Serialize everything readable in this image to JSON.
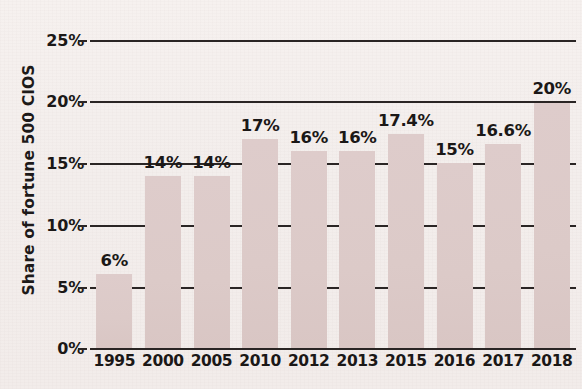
{
  "chart_data": {
    "type": "bar",
    "title": "",
    "subtitle": "",
    "xlabel": "",
    "ylabel": "Share of fortune 500 CIOS",
    "categories": [
      "1995",
      "2000",
      "2005",
      "2010",
      "2012",
      "2013",
      "2015",
      "2016",
      "2017",
      "2018"
    ],
    "values": [
      6,
      14,
      14,
      17,
      16,
      16,
      17.4,
      15,
      16.6,
      20
    ],
    "data_labels": [
      "6%",
      "14%",
      "14%",
      "17%",
      "16%",
      "16%",
      "17.4%",
      "15%",
      "16.6%",
      "20%"
    ],
    "ylim": [
      0,
      25
    ],
    "ytick_values": [
      0,
      5,
      10,
      15,
      20,
      25
    ],
    "ytick_labels": [
      "0%",
      "5%",
      "10%",
      "15%",
      "20%",
      "25%"
    ],
    "grid": true,
    "grid_axis": "y",
    "legend": false,
    "legend_position": "none",
    "bar_color": "#ddcbc9",
    "text_color": "#1b1817",
    "grid_color": "#2a2524",
    "background_color": "#f3eeec",
    "units": "percent"
  },
  "axis": {
    "y_title": "Share of fortune 500 CIOS"
  }
}
